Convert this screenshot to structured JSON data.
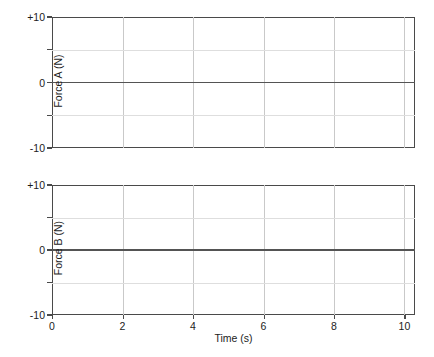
{
  "figure": {
    "background": "#ffffff",
    "frame_color": "#4a4a4a",
    "grid_color": "#c9c9c9",
    "trace_color": "#545454"
  },
  "chart_data": [
    {
      "type": "line",
      "title": "",
      "ylabel": "Force A (N)",
      "xlabel": "",
      "xlim": [
        0,
        10.3
      ],
      "ylim": [
        -10,
        10
      ],
      "grid": true,
      "legend": "none",
      "yticks": [
        10,
        5,
        0,
        -5,
        -10
      ],
      "ytick_labels": [
        "+10",
        "",
        "0",
        "",
        "-10"
      ],
      "xticks": [
        0,
        2,
        4,
        6,
        8,
        10
      ],
      "xtick_labels": [
        "0",
        "2",
        "4",
        "6",
        "8",
        "10"
      ],
      "series": [
        {
          "name": "Force A",
          "x": [
            0,
            1,
            2,
            3,
            4,
            5,
            6,
            7,
            8,
            9,
            10,
            10.3
          ],
          "values": [
            0,
            0,
            0,
            0,
            0,
            0,
            0,
            0,
            0,
            0,
            0,
            0
          ]
        }
      ]
    },
    {
      "type": "line",
      "title": "",
      "ylabel": "Force B (N)",
      "xlabel": "Time (s)",
      "xlim": [
        0,
        10.3
      ],
      "ylim": [
        -10,
        10
      ],
      "grid": true,
      "legend": "none",
      "yticks": [
        10,
        5,
        0,
        -5,
        -10
      ],
      "ytick_labels": [
        "+10",
        "",
        "0",
        "",
        "-10"
      ],
      "xticks": [
        0,
        2,
        4,
        6,
        8,
        10
      ],
      "xtick_labels": [
        "0",
        "2",
        "4",
        "6",
        "8",
        "10"
      ],
      "series": [
        {
          "name": "Force B",
          "x": [
            0,
            1,
            2,
            3,
            4,
            5,
            6,
            7,
            8,
            9,
            10,
            10.3
          ],
          "values": [
            0,
            0,
            0,
            0,
            0,
            0,
            0,
            0,
            0,
            0,
            0,
            0
          ]
        }
      ]
    }
  ],
  "axes": {
    "y_tick_labels": [
      "+10",
      "0",
      "-10"
    ],
    "x_tick_labels": [
      "0",
      "2",
      "4",
      "6",
      "8",
      "10"
    ],
    "x_title": "Time (s)",
    "panel_a_title": "Force A (N)",
    "panel_b_title": "Force B (N)"
  }
}
